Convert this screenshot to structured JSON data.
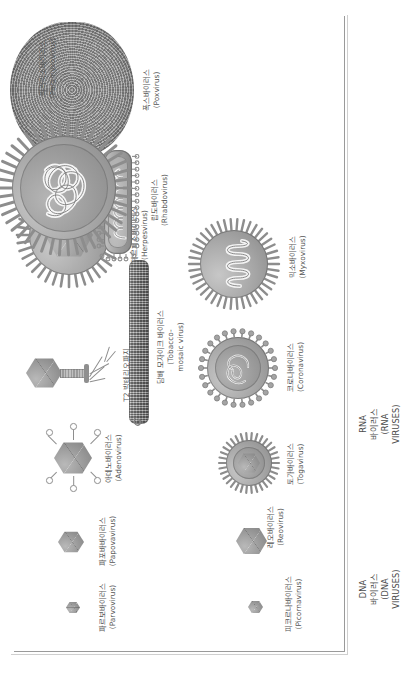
{
  "figure": {
    "type": "scientific-illustration-plate",
    "axis": {
      "has_left_axis": true,
      "has_bottom_axis": true
    }
  },
  "rows": [
    {
      "id": "dna",
      "label_lines": [
        "DNA",
        "바이러스",
        "(DNA",
        "VIRUSES)"
      ],
      "label_ko": "DNA 바이러스",
      "label_en": "(DNA VIRUSES)"
    },
    {
      "id": "rna",
      "label_lines": [
        "RNA",
        "바이러스",
        "(RNA",
        "VIRUSES)"
      ],
      "label_ko": "RNA 바이러스",
      "label_en": "(RNA VIRUSES)"
    }
  ],
  "dna_viruses": [
    {
      "ko": "파르보바이러스",
      "en": "(Parvovirus)",
      "shape": "icosahedral"
    },
    {
      "ko": "파포바바이러스",
      "en": "(Papovavirus)",
      "shape": "icosahedral"
    },
    {
      "ko": "아데노바이러스",
      "en": "(Adenovirus)",
      "shape": "icosahedral-with-fibers"
    },
    {
      "ko": "T2 박테리오파지",
      "en": "(T2 Bacteriophage)",
      "shape": "head-tail-phage"
    },
    {
      "ko": "헤르페스바이러스",
      "en": "(Herpesvirus)",
      "shape": "enveloped-icosahedral"
    },
    {
      "ko": "폭스바이러스",
      "en": "(Poxvirus)",
      "shape": "brick-ovoid"
    }
  ],
  "rna_viruses": [
    {
      "ko": "피코르나바이러스",
      "en": "(Picornavirus)",
      "shape": "icosahedral"
    },
    {
      "ko": "레오바이러스",
      "en": "(Reovirus)",
      "shape": "icosahedral"
    },
    {
      "ko": "토가바이러스",
      "en": "(Togavirus)",
      "shape": "enveloped-spiked-icosahedral"
    },
    {
      "ko": "코로나바이러스",
      "en": "(Coronavirus)",
      "shape": "enveloped-club-spikes"
    },
    {
      "ko": "믹소바이러스",
      "en": "(Myxovirus)",
      "shape": "enveloped-helical"
    },
    {
      "ko": "담배 모자이크 바이러스",
      "en_lines": [
        "(Tobacco-",
        "mosaic virus)"
      ],
      "en": "(Tobacco-mosaic virus)",
      "shape": "rigid-rod"
    },
    {
      "ko": "랍도바이러스",
      "en": "(Rhabdovirus)",
      "shape": "bullet-shaped"
    },
    {
      "ko": "파라믹소바이러스",
      "en": "(Paramyxovirus)",
      "shape": "enveloped-large-helical"
    }
  ],
  "colors": {
    "background": "#ffffff",
    "ink": "#555555",
    "axis": "#9a9a9a",
    "specimen_light": "#c7c7c7",
    "specimen_mid": "#9d9d9d",
    "specimen_dark": "#7d7d7d"
  }
}
